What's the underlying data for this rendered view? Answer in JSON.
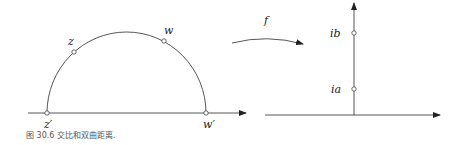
{
  "figure": {
    "caption": "图 30.6 交比和双曲距离.",
    "left_panel": {
      "points": [
        {
          "label": "z",
          "role": "point-on-geodesic"
        },
        {
          "label": "w",
          "role": "point-on-geodesic"
        },
        {
          "label": "z′",
          "role": "endpoint-on-real-axis"
        },
        {
          "label": "w′",
          "role": "endpoint-on-real-axis"
        }
      ]
    },
    "map": {
      "label": "f"
    },
    "right_panel": {
      "points": [
        {
          "label": "ib",
          "role": "point-on-imaginary-axis"
        },
        {
          "label": "ia",
          "role": "point-on-imaginary-axis"
        }
      ]
    }
  }
}
